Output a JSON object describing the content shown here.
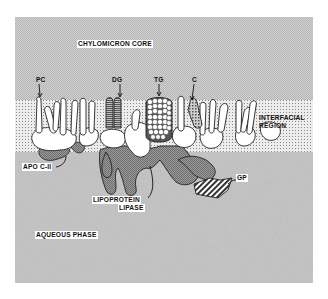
{
  "figure": {
    "type": "schematic diagram",
    "regions": [
      {
        "id": "core",
        "label": "CHYLOMICRON CORE"
      },
      {
        "id": "interface",
        "label_line1": "INTERFACIAL",
        "label_line2": "REGION"
      },
      {
        "id": "aqueous",
        "label": "AQUEOUS PHASE"
      }
    ],
    "molecule_labels": [
      {
        "id": "pc",
        "text": "PC"
      },
      {
        "id": "dg",
        "text": "DG"
      },
      {
        "id": "tg",
        "text": "TG"
      },
      {
        "id": "c",
        "text": "C"
      }
    ],
    "protein_labels": {
      "apo": "APO C-II",
      "lpl_line1": "LIPOPROTEIN",
      "lpl_line2": "LIPASE",
      "gp": "GP"
    }
  },
  "colors": {
    "core_fill": "#c9c9c9",
    "interface_fill": "#e3e3e3",
    "aqueous_fill": "#bdbdbd",
    "protein_fill": "#8e8e8e",
    "lipid_fill": "#ffffff",
    "outline": "#222222"
  }
}
